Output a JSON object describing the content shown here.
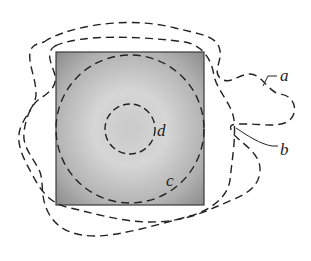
{
  "diagram": {
    "type": "gaussian-surfaces",
    "labels": {
      "a": "a",
      "b": "b",
      "c": "c",
      "d": "d"
    },
    "colors": {
      "square_edge": "#555555",
      "square_center": "#d4d4d4",
      "square_corner": "#8a8a8a",
      "dash": "#222222"
    }
  }
}
